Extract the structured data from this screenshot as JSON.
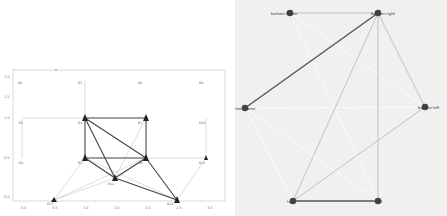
{
  "left_plot": {
    "title_marker": "—",
    "x_ticks": [
      "0.0",
      "0.5",
      "1.0",
      "1.5",
      "2.0",
      "2.5",
      "3.0"
    ],
    "y_ticks": [
      "2.0",
      "1.5",
      "1.0",
      "0.5",
      "0.0"
    ],
    "nodes": [
      {
        "id": "B1",
        "label": "B0",
        "x": 0,
        "y": 3
      },
      {
        "id": "B2",
        "label": "B1",
        "x": 0,
        "y": 2
      },
      {
        "id": "B3",
        "label": "B2",
        "x": 0,
        "y": 1
      },
      {
        "id": "B4",
        "label": "B3",
        "x": 1,
        "y": 3
      },
      {
        "id": "B5",
        "label": "B4",
        "x": 1,
        "y": 2
      },
      {
        "id": "B6",
        "label": "B5",
        "x": 1,
        "y": 1
      },
      {
        "id": "B7",
        "label": "B6",
        "x": 2,
        "y": 3
      },
      {
        "id": "B8",
        "label": "B7",
        "x": 2,
        "y": 2
      },
      {
        "id": "B9",
        "label": "B8",
        "x": 2,
        "y": 1
      },
      {
        "id": "B10",
        "label": "B9",
        "x": 3,
        "y": 3
      },
      {
        "id": "B11",
        "label": "B10",
        "x": 3,
        "y": 2
      },
      {
        "id": "B12",
        "label": "B11",
        "x": 3,
        "y": 1
      },
      {
        "id": "B13",
        "label": "B12",
        "x": 1.5,
        "y": 0.5
      },
      {
        "id": "B14",
        "label": "B13",
        "x": 0.5,
        "y": 0
      },
      {
        "id": "B15",
        "label": "B14",
        "x": 2.5,
        "y": 0
      }
    ]
  },
  "right_graph": {
    "nodes": [
      {
        "id": "n1",
        "label": "bottom-frame"
      },
      {
        "id": "n2",
        "label": "bottom-right"
      },
      {
        "id": "n3",
        "label": "bottom-frame"
      },
      {
        "id": "n4",
        "label": "bottom-left"
      },
      {
        "id": "n5",
        "label": "top"
      },
      {
        "id": "n6",
        "label": "left"
      }
    ]
  }
}
